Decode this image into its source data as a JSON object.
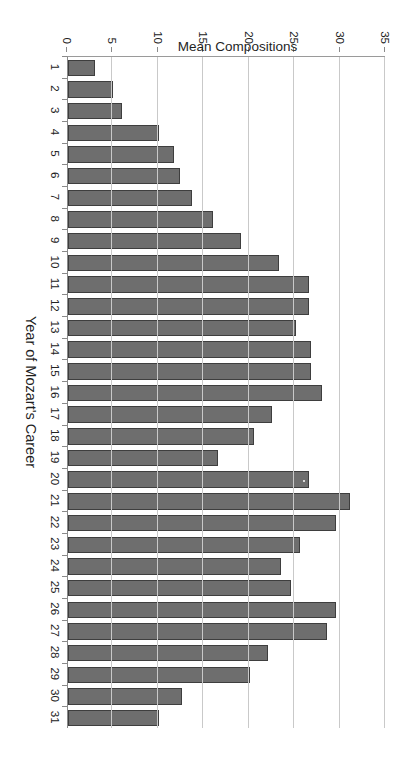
{
  "chart_data": {
    "type": "bar",
    "title": "",
    "subtitle": "",
    "orientation": "vertical-bars-rendered-rotated-90cw",
    "xlabel": "Year of Mozart's Career",
    "ylabel": "Mean Compositions",
    "ylim": [
      0,
      35
    ],
    "ytick_values": [
      0,
      5,
      10,
      15,
      20,
      25,
      30,
      35
    ],
    "ytick_labels": [
      "0",
      "5",
      "10",
      "15",
      "20",
      "25",
      "30",
      "35"
    ],
    "grid": "value-axis gridlines only",
    "legend": "none",
    "bar_color": "#6e6e6e",
    "bar_edge_color": "#3e3e3e",
    "categories": [
      "1",
      "2",
      "3",
      "4",
      "5",
      "6",
      "7",
      "8",
      "9",
      "10",
      "11",
      "12",
      "13",
      "14",
      "15",
      "16",
      "17",
      "18",
      "19",
      "20",
      "21",
      "22",
      "23",
      "24",
      "25",
      "26",
      "27",
      "28",
      "29",
      "30",
      "31"
    ],
    "values": [
      3,
      5,
      6,
      10,
      11.7,
      12.3,
      13.6,
      16,
      19,
      23.2,
      26.5,
      26.5,
      25.1,
      26.7,
      26.7,
      28,
      22.5,
      20.5,
      16.5,
      26.5,
      31,
      29.5,
      25.5,
      23.5,
      24.5,
      29.5,
      28.5,
      22,
      20,
      12.5,
      10
    ],
    "series": [
      {
        "name": "Mean Compositions",
        "values": [
          3,
          5,
          6,
          10,
          11.7,
          12.3,
          13.6,
          16,
          19,
          23.2,
          26.5,
          26.5,
          25.1,
          26.7,
          26.7,
          28,
          22.5,
          20.5,
          16.5,
          26.5,
          31,
          29.5,
          25.5,
          23.5,
          24.5,
          29.5,
          28.5,
          22,
          20,
          12.5,
          10
        ]
      }
    ]
  },
  "axes": {
    "value_axis_title": "Mean Compositions",
    "category_axis_title": "Year of Mozart's Career"
  }
}
